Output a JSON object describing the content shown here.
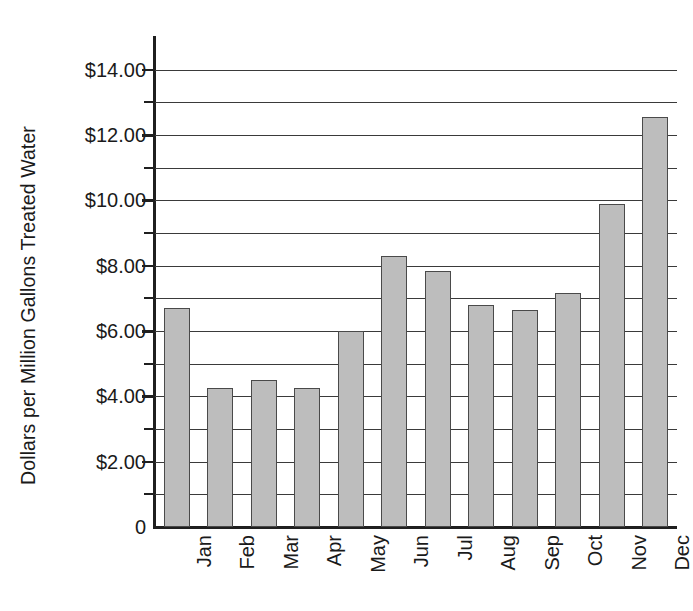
{
  "chart_data": {
    "type": "bar",
    "title": "",
    "xlabel": "",
    "ylabel": "Dollars per Million Gallons Treated Water",
    "categories": [
      "Jan",
      "Feb",
      "Mar",
      "Apr",
      "May",
      "Jun",
      "Jul",
      "Aug",
      "Sep",
      "Oct",
      "Nov",
      "Dec"
    ],
    "values": [
      6.7,
      4.25,
      4.5,
      4.25,
      6.0,
      8.3,
      7.85,
      6.8,
      6.65,
      7.15,
      9.9,
      12.55
    ],
    "ylim": [
      0,
      15
    ],
    "y_tick_labels": [
      "0",
      "$2.00",
      "$4.00",
      "$6.00",
      "$8.00",
      "$10.00",
      "$12.00",
      "$14.00"
    ],
    "y_tick_values": [
      0,
      2,
      4,
      6,
      8,
      10,
      12,
      14
    ],
    "y_gridline_values": [
      1,
      2,
      3,
      4,
      5,
      6,
      7,
      8,
      9,
      10,
      11,
      12,
      13,
      14
    ],
    "y_minor_tick_values": [
      1,
      3,
      5,
      7,
      9,
      11,
      13
    ],
    "grid": true,
    "legend": false,
    "legend_position": "none",
    "bar_fill_color": "#bdbdbd",
    "bar_border_color": "#4a4a4a",
    "axis_color": "#1f1f1f",
    "grid_color": "#3a3a3a",
    "background_color": "#ffffff"
  }
}
